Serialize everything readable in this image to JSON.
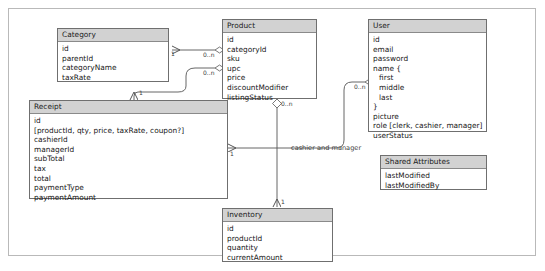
{
  "diagram": {
    "background_color": "#ffffff",
    "frame_border_color": "#b9b9b9",
    "entity_header_color": "#d2d2d2",
    "entity_border_color": "#6f6f6f",
    "line_color": "#555555"
  },
  "entities": [
    {
      "id": "category",
      "name": "Category",
      "fields": [
        "id",
        "parentId",
        "categoryName",
        "taxRate"
      ]
    },
    {
      "id": "product",
      "name": "Product",
      "fields": [
        "id",
        "categoryId",
        "sku",
        "upc",
        "price",
        "discountModifier",
        "listingStatus"
      ]
    },
    {
      "id": "user",
      "name": "User",
      "fields": [
        "id",
        "email",
        "password",
        "name {",
        "first",
        "middle",
        "last",
        "}",
        "picture",
        "role [clerk, cashier, manager]",
        "userStatus"
      ]
    },
    {
      "id": "receipt",
      "name": "Receipt",
      "fields": [
        "id",
        "[productId, qty, price, taxRate, coupon?]",
        "cashierId",
        "managerId",
        "subTotal",
        "tax",
        "total",
        "paymentType",
        "paymentAmount"
      ]
    },
    {
      "id": "inventory",
      "name": "Inventory",
      "fields": [
        "id",
        "productId",
        "quantity",
        "currentAmount"
      ]
    },
    {
      "id": "shared_attributes",
      "name": "Shared Attributes",
      "fields": [
        "lastModified",
        "lastModifiedBy"
      ]
    }
  ],
  "relationships": [
    {
      "id": "product-category",
      "from": "product",
      "to": "category",
      "from_multiplicity": "0..n",
      "to_multiplicity": "1",
      "label": ""
    },
    {
      "id": "product-receipt",
      "from": "product",
      "to": "receipt",
      "from_multiplicity": "0..n",
      "to_multiplicity": "1",
      "label": ""
    },
    {
      "id": "product-inventory",
      "from": "product",
      "to": "inventory",
      "from_multiplicity": "0..n",
      "to_multiplicity": "1",
      "label": ""
    },
    {
      "id": "user-receipt",
      "from": "user",
      "to": "receipt",
      "from_multiplicity": "0..n",
      "to_multiplicity": "1",
      "label": "cashier and manager"
    }
  ],
  "edge_labels": {
    "category_to_product_near_category": "1",
    "product_to_category_near_product": "0..n",
    "receipt_top_near_receipt": "1",
    "product_to_receipt_near_product": "0..n",
    "product_to_inventory_near_product": "0..n",
    "inventory_near_inventory": "1",
    "user_near_user": "0..n",
    "receipt_right_near_receipt": "1",
    "user_receipt_relation": "cashier and manager"
  }
}
